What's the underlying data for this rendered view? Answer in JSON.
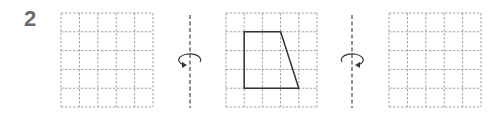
{
  "problem": {
    "number": "2"
  },
  "grids": [
    {
      "name": "left-grid",
      "x": 61,
      "y": 13,
      "cols": 5,
      "rows": 5,
      "cell_w": 18.4,
      "cell_h": 18.8
    },
    {
      "name": "middle-grid",
      "x": 226,
      "y": 13,
      "cols": 5,
      "rows": 5,
      "cell_w": 18.2,
      "cell_h": 18.8
    },
    {
      "name": "right-grid",
      "x": 389,
      "y": 13,
      "cols": 5,
      "rows": 5,
      "cell_w": 18.4,
      "cell_h": 18.8
    }
  ],
  "shape": {
    "type": "trapezoid",
    "grid": "middle-grid",
    "vertices_grid": [
      [
        1,
        1
      ],
      [
        3,
        1
      ],
      [
        4,
        4
      ],
      [
        1,
        4
      ]
    ]
  },
  "axes": [
    {
      "name": "rotation-axis-left",
      "x": 190,
      "y1": 15,
      "y2": 108,
      "arrow_direction": "counterclockwise-left"
    },
    {
      "name": "rotation-axis-right",
      "x": 352,
      "y1": 15,
      "y2": 108,
      "arrow_direction": "clockwise-right"
    }
  ],
  "colors": {
    "grid": "#9a9a9a",
    "shape": "#333333",
    "axis": "#555555",
    "number": "#6a6a6a"
  }
}
